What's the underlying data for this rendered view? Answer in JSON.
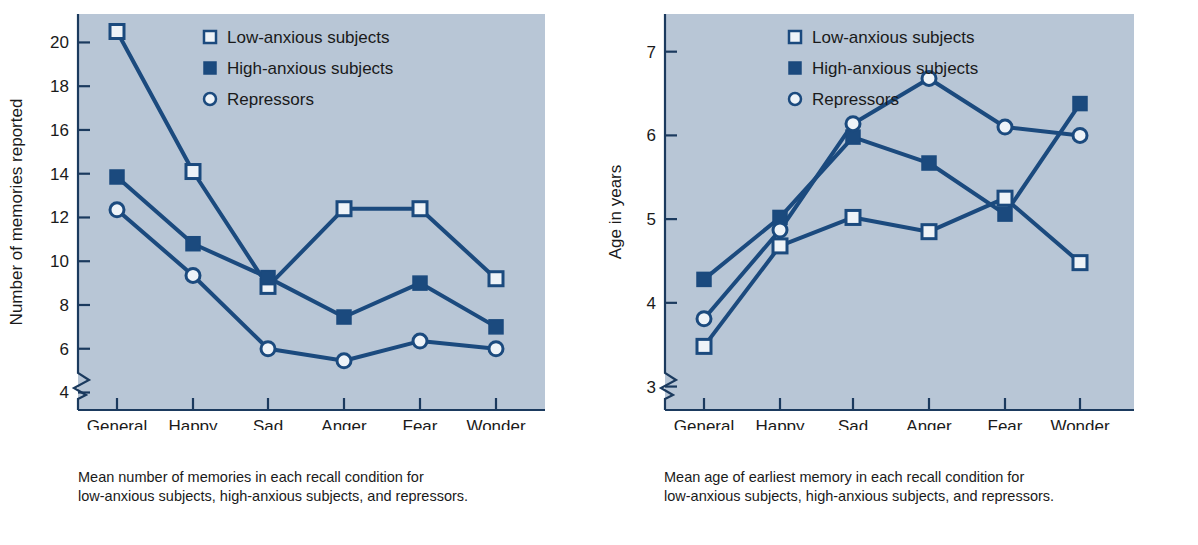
{
  "figure": {
    "background": "#ffffff",
    "plot_background": "#b8c6d6",
    "series_color": "#1b4a7e",
    "marker_open_fill": "#eef3f8",
    "axis_color": "#1b3a5e"
  },
  "legend": {
    "items": [
      {
        "label": "Low-anxious subjects",
        "marker": "open-square-marker"
      },
      {
        "label": "High-anxious subjects",
        "marker": "filled-square-marker"
      },
      {
        "label": "Repressors",
        "marker": "open-circle-marker"
      }
    ]
  },
  "panels": [
    {
      "id": "left",
      "caption": "Mean number of memories in each recall condition for\nlow-anxious subjects, high-anxious subjects, and repressors.",
      "chart_data": {
        "type": "line",
        "title": "",
        "xlabel": "Recall condition",
        "ylabel": "Number of memories reported",
        "categories": [
          "General",
          "Happy",
          "Sad",
          "Anger",
          "Fear",
          "Wonder"
        ],
        "yticks": [
          4,
          6,
          8,
          10,
          12,
          14,
          16,
          18,
          20
        ],
        "ylim": [
          3.2,
          21.3
        ],
        "axis_break": true,
        "grid": false,
        "legend_position": "top-center",
        "series": [
          {
            "name": "Low-anxious subjects",
            "marker": "open-square",
            "values": [
              20.5,
              14.1,
              8.85,
              12.4,
              12.4,
              9.2
            ]
          },
          {
            "name": "High-anxious subjects",
            "marker": "filled-square",
            "values": [
              13.85,
              10.8,
              9.25,
              7.45,
              9.0,
              7.0
            ]
          },
          {
            "name": "Repressors",
            "marker": "open-circle",
            "values": [
              12.35,
              9.35,
              6.0,
              5.45,
              6.35,
              6.0
            ]
          }
        ]
      }
    },
    {
      "id": "right",
      "caption": "Mean age of earliest memory in each recall condition for\nlow-anxious subjects, high-anxious subjects, and repressors.",
      "chart_data": {
        "type": "line",
        "title": "",
        "xlabel": "Recall condition",
        "ylabel": "Age in years",
        "categories": [
          "General",
          "Happy",
          "Sad",
          "Anger",
          "Fear",
          "Wonder"
        ],
        "yticks": [
          3,
          4,
          5,
          6,
          7
        ],
        "ylim": [
          2.72,
          7.45
        ],
        "axis_break": true,
        "grid": false,
        "legend_position": "top-center",
        "series": [
          {
            "name": "Low-anxious subjects",
            "marker": "open-square",
            "values": [
              3.48,
              4.68,
              5.02,
              4.85,
              5.25,
              4.48
            ]
          },
          {
            "name": "High-anxious subjects",
            "marker": "filled-square",
            "values": [
              4.28,
              5.02,
              5.98,
              5.67,
              5.06,
              6.38
            ]
          },
          {
            "name": "Repressors",
            "marker": "open-circle",
            "values": [
              3.81,
              4.87,
              6.14,
              6.68,
              6.1,
              6.0
            ]
          }
        ]
      }
    }
  ]
}
